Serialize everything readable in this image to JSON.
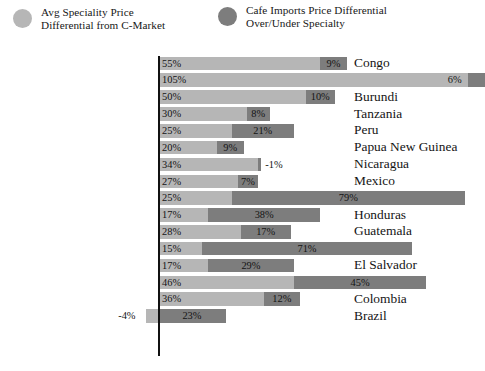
{
  "legend": {
    "items": [
      {
        "label": "Avg Speciality Price\nDifferential from C-Market",
        "color": "#b6b6b6",
        "icon": "circle-swatch-icon"
      },
      {
        "label": "Cafe Imports Price Differential\nOver/Under Specialty",
        "color": "#7d7d7d",
        "icon": "circle-swatch-icon"
      }
    ]
  },
  "chart_data": {
    "type": "bar",
    "orientation": "horizontal",
    "stacked": true,
    "title": "",
    "subtitle": "",
    "xlabel": "",
    "ylabel": "",
    "grid": false,
    "legend_position": "top",
    "axis_at": 0,
    "xlim": [
      -10,
      112
    ],
    "colors": {
      "primary": "#b6b6b6",
      "secondary": "#7d7d7d",
      "axis": "#111111"
    },
    "categories": [
      "Congo",
      "Rwanda",
      "Burundi",
      "Tanzania",
      "Peru",
      "Papua New Guinea",
      "Nicaragua",
      "Mexico",
      "Kenya",
      "Honduras",
      "Guatemala",
      "Ethiopia",
      "El Salvador",
      "Costa Rica",
      "Colombia",
      "Brazil"
    ],
    "series": [
      {
        "name": "Avg Speciality Price Differential from C-Market",
        "color": "#b6b6b6",
        "values": [
          55,
          105,
          50,
          30,
          25,
          20,
          34,
          27,
          25,
          17,
          28,
          15,
          17,
          46,
          36,
          -4
        ],
        "labels": [
          "55%",
          "105%",
          "50%",
          "30%",
          "25%",
          "20%",
          "34%",
          "27%",
          "25%",
          "17%",
          "28%",
          "15%",
          "17%",
          "46%",
          "36%",
          "-4%"
        ]
      },
      {
        "name": "Cafe Imports Price Differential Over/Under Specialty",
        "color": "#7d7d7d",
        "values": [
          9,
          6,
          10,
          8,
          21,
          9,
          -1,
          7,
          79,
          38,
          17,
          71,
          29,
          45,
          12,
          23
        ],
        "labels": [
          "9%",
          "6%",
          "10%",
          "8%",
          "21%",
          "9%",
          "-1%",
          "7%",
          "79%",
          "38%",
          "17%",
          "71%",
          "29%",
          "45%",
          "12%",
          "23%"
        ]
      }
    ]
  }
}
